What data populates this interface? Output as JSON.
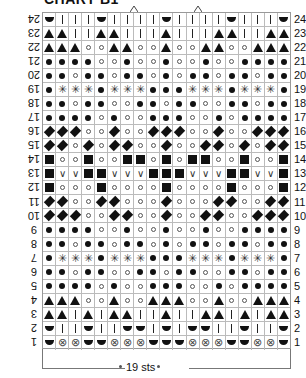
{
  "title": "CHART B1",
  "width_label": "19 sts",
  "stitch_count": 19,
  "row_count": 24,
  "caret_columns": [
    7.5,
    12.5
  ],
  "symbols": {
    "|": "knit-bar",
    "U": "purl-half-circle",
    "A": "triangle",
    "D": "dot-large",
    "o": "dot-small-ring",
    "*": "asterisk",
    "F": "diamond",
    "S": "square",
    "V": "v-mark",
    "X": "circle-x"
  },
  "rows": [
    {
      "n": 24,
      "cells": "U|||U||||U||||U|||U"
    },
    {
      "n": 23,
      "cells": "AA||AA|||A|||AA||AA"
    },
    {
      "n": 22,
      "cells": "AAAooAAooAooAAooAAA"
    },
    {
      "n": 21,
      "cells": "DDDDooDooDooDooDDDD"
    },
    {
      "n": 20,
      "cells": "DDoDDoDDoDoDDoDDoDD"
    },
    {
      "n": 19,
      "cells": "D***D***DDD***D***D"
    },
    {
      "n": 18,
      "cells": "DDoDDooDDoDDooDDoDD"
    },
    {
      "n": 17,
      "cells": "DDDDoDooDDDooDoDDDD"
    },
    {
      "n": 16,
      "cells": "FFFooFooFFFooFooFFF"
    },
    {
      "n": 15,
      "cells": "FFoFoFFooFooFFoFoFF"
    },
    {
      "n": 14,
      "cells": "SooSooSSoSoSSooSooS"
    },
    {
      "n": 13,
      "cells": "SVVSSVVVSSSVVVSSVVS"
    },
    {
      "n": 12,
      "cells": "SoooSooooSooooSoooS"
    },
    {
      "n": 11,
      "cells": "FFooFFoooFoooFFooFF"
    },
    {
      "n": 10,
      "cells": "FFFooFFooFooFFooFFF"
    },
    {
      "n": 9,
      "cells": "DDDDooDooDooDooDDDD"
    },
    {
      "n": 8,
      "cells": "DDoDDoDDoDoDDoDDoDD"
    },
    {
      "n": 7,
      "cells": "D***D***DDD***D***D"
    },
    {
      "n": 6,
      "cells": "DDoDDooDDoDDooDDoDD"
    },
    {
      "n": 5,
      "cells": "DDDDoDooDDDooDoDDDD"
    },
    {
      "n": 4,
      "cells": "AAAooAooAAAooAooAAA"
    },
    {
      "n": 3,
      "cells": "AA|A|AA||A||AA|A|AA"
    },
    {
      "n": 2,
      "cells": "U||U||UU|U|UU||U||U"
    },
    {
      "n": 1,
      "cells": "UXXUUXXXUUUXXXUUXXU"
    }
  ]
}
